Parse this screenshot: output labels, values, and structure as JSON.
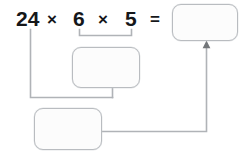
{
  "worksheet": {
    "title": "Multiplication regrouping task",
    "equation": {
      "term1": "24",
      "operator1": "×",
      "term2": "6",
      "operator2": "×",
      "term3": "5",
      "equals": "="
    },
    "boxes": {
      "result_box": {
        "label": "final-answer",
        "value": ""
      },
      "middle_box": {
        "label": "product-of-6-and-5",
        "value": ""
      },
      "bottom_box": {
        "label": "product-of-24-and-group",
        "value": ""
      }
    },
    "annotations": {
      "bracket_label": "groups 6 and 5",
      "arrow_label": "points to final answer"
    },
    "colors": {
      "text": "#15171a",
      "box_border": "#b9bcc0",
      "box_fill": "#fcfcfc",
      "connector": "#b0b3b7",
      "background": "#ffffff"
    }
  }
}
